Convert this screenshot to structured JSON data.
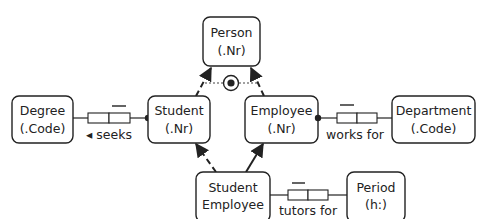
{
  "diagram": {
    "type": "ORM",
    "colors": {
      "stroke": "#222222",
      "background": "#ffffff"
    },
    "entities": {
      "person": {
        "line1": "Person",
        "line2": "(.Nr)"
      },
      "student": {
        "line1": "Student",
        "line2": "(.Nr)"
      },
      "employee": {
        "line1": "Employee",
        "line2": "(.Nr)"
      },
      "degree": {
        "line1": "Degree",
        "line2": "(.Code)"
      },
      "department": {
        "line1": "Department",
        "line2": "(.Code)"
      },
      "student_employee": {
        "line1": "Student",
        "line2": "Employee"
      },
      "period": {
        "line1": "Period",
        "line2": "(h:)"
      }
    },
    "fact_types": {
      "seeks": {
        "label": "◂ seeks",
        "arrow": "◂",
        "text": "seeks"
      },
      "works_for": {
        "label": "works for"
      },
      "tutors_for": {
        "label": "tutors for"
      }
    },
    "constraints": {
      "exclusive_or": {
        "name": "exclusive-or",
        "between": [
          "Student",
          "Employee"
        ]
      }
    },
    "subtype_links": [
      {
        "from": "Student",
        "to": "Person",
        "style": "dashed"
      },
      {
        "from": "Employee",
        "to": "Person",
        "style": "dashed"
      },
      {
        "from": "Student Employee",
        "to": "Student",
        "style": "dashed"
      },
      {
        "from": "Student Employee",
        "to": "Employee",
        "style": "solid"
      }
    ]
  }
}
